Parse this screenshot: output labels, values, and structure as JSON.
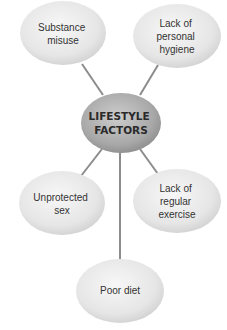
{
  "diagram": {
    "type": "mind-map",
    "center": {
      "lines": [
        "LIFESTYLE",
        "FACTORS"
      ]
    },
    "nodes": [
      {
        "id": "substance-misuse",
        "lines": [
          "Substance",
          "misuse"
        ]
      },
      {
        "id": "lack-personal-hygiene",
        "lines": [
          "Lack of",
          "personal",
          "hygiene"
        ]
      },
      {
        "id": "unprotected-sex",
        "lines": [
          "Unprotected",
          "sex"
        ]
      },
      {
        "id": "lack-regular-exercise",
        "lines": [
          "Lack of",
          "regular",
          "exercise"
        ]
      },
      {
        "id": "poor-diet",
        "lines": [
          "Poor diet"
        ]
      }
    ],
    "colors": {
      "node_fill_light": "#f4f4f4",
      "node_fill_dark": "#d2d2d2",
      "center_fill_light": "#c4c4c4",
      "center_fill_dark": "#8a8a8a",
      "connector": "#8c8c8c",
      "text": "#333333"
    }
  }
}
